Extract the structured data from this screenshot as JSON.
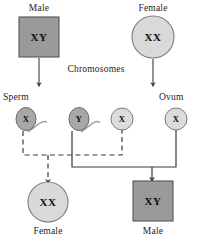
{
  "diagram": {
    "caption_label": "Chromosomes",
    "colors": {
      "male_fill": "#9a9a9a",
      "male_stroke": "#555555",
      "female_fill": "#d9d9d9",
      "female_stroke": "#7d7d7d",
      "sperm_fill": "#a8a8a8",
      "sperm_stroke": "#6b6b6b",
      "ovum_fill": "#dcdcdc",
      "ovum_stroke": "#7d7d7d",
      "line": "#3a3a3a",
      "text": "#121212"
    },
    "parents": [
      {
        "id": "parent-male",
        "label": "Male",
        "genotype": "XY",
        "shape": "square"
      },
      {
        "id": "parent-female",
        "label": "Female",
        "genotype": "XX",
        "shape": "circle"
      }
    ],
    "gametes": [
      {
        "id": "gamete-sperm-x",
        "label": "Sperm",
        "allele": "X",
        "type": "sperm"
      },
      {
        "id": "gamete-sperm-y",
        "label": "",
        "allele": "Y",
        "type": "sperm"
      },
      {
        "id": "gamete-ovum-x-left",
        "label": "",
        "allele": "X",
        "type": "ovum"
      },
      {
        "id": "gamete-ovum-x-right",
        "label": "Ovum",
        "allele": "X",
        "type": "ovum"
      }
    ],
    "offspring": [
      {
        "id": "offspring-female",
        "label": "Female",
        "genotype": "XX",
        "shape": "circle"
      },
      {
        "id": "offspring-male",
        "label": "Male",
        "genotype": "XY",
        "shape": "square"
      }
    ]
  }
}
